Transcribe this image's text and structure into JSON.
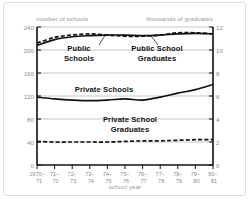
{
  "figure": {
    "left_axis_title": "number of schools",
    "right_axis_title": "thousands of graduates",
    "x_axis_title": "school year"
  },
  "annotations": {
    "public_schools_l1": "Public",
    "public_schools_l2": "Schools",
    "public_grads_l1": "Public School",
    "public_grads_l2": "Graduates",
    "private_schools": "Private Schools",
    "private_grads_l1": "Private School",
    "private_grads_l2": "Graduates"
  },
  "ticks": {
    "left": [
      "240",
      "200",
      "160",
      "120",
      "80",
      "40",
      "0"
    ],
    "right": [
      "12",
      "10",
      "8",
      "6",
      "4",
      "2",
      "0"
    ],
    "x_top": [
      "1970–",
      "71–",
      "72–",
      "73–",
      "74–",
      "75–",
      "76–",
      "77–",
      "78–",
      "79–",
      "80–"
    ],
    "x_bottom": [
      "71",
      "72",
      "73",
      "74",
      "75",
      "76",
      "77",
      "78",
      "79",
      "80",
      "81"
    ]
  },
  "colors": {
    "grid": "#b9b9b5",
    "axis": "#111111",
    "series": "#111111",
    "label_gray": "#8e8e8a",
    "frame": "#dededc"
  },
  "chart_data": {
    "type": "line",
    "title": "",
    "xlabel": "school year",
    "ylabel": "number of schools",
    "y2label": "thousands of graduates",
    "ylim": [
      0,
      240
    ],
    "y2lim": [
      0,
      12
    ],
    "yticks": [
      0,
      40,
      80,
      120,
      160,
      200,
      240
    ],
    "y2ticks": [
      0,
      2,
      4,
      6,
      8,
      10,
      12
    ],
    "grid": true,
    "legend": "none (direct in-plot labels)",
    "categories": [
      "1970–71",
      "71–72",
      "72–73",
      "73–74",
      "74–75",
      "75–76",
      "76–77",
      "77–78",
      "78–79",
      "79–80",
      "80–81"
    ],
    "series": [
      {
        "name": "Public Schools",
        "axis": "left",
        "style": "solid",
        "unit": "number of schools (thousands)",
        "values": [
          208,
          218,
          223,
          225,
          226,
          226,
          225,
          226,
          228,
          229,
          228
        ]
      },
      {
        "name": "Public School Graduates",
        "axis": "right",
        "style": "dashed",
        "unit": "thousands of graduates",
        "values": [
          10.6,
          11.1,
          11.3,
          11.4,
          11.3,
          11.2,
          11.2,
          11.3,
          11.5,
          11.5,
          11.4
        ]
      },
      {
        "name": "Private Schools",
        "axis": "left",
        "style": "solid",
        "unit": "number of schools (thousands)",
        "values": [
          118,
          115,
          113,
          112,
          113,
          115,
          113,
          118,
          125,
          131,
          140
        ]
      },
      {
        "name": "Private School Graduates",
        "axis": "right",
        "style": "dashed",
        "unit": "thousands of graduates",
        "values": [
          2.05,
          2.0,
          2.0,
          2.0,
          2.0,
          2.05,
          2.1,
          2.1,
          2.15,
          2.2,
          2.2
        ]
      }
    ]
  }
}
